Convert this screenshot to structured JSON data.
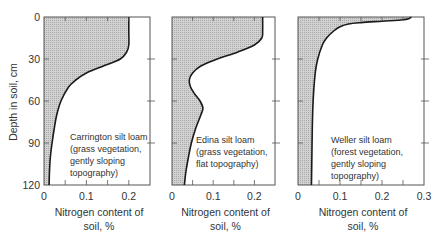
{
  "chart_data": [
    {
      "type": "area",
      "title": "Carrington silt loam",
      "annotation": [
        "Carrington silt loam",
        "(grass vegetation,",
        "gently sloping",
        "topography)"
      ],
      "xlabel": [
        "Nitrogen content of",
        "soil, %"
      ],
      "ylabel": "Depth in soil, cm",
      "xlim": [
        0,
        0.25
      ],
      "ylim": [
        120,
        0
      ],
      "xticks": [
        "0",
        "0.1",
        "0.2"
      ],
      "yticks": [
        "0",
        "30",
        "60",
        "90",
        "120"
      ],
      "depth_cm": [
        0,
        10,
        20,
        25,
        30,
        35,
        40,
        45,
        50,
        60,
        70,
        80,
        90,
        100,
        110,
        120
      ],
      "nitrogen_pct": [
        0.2,
        0.2,
        0.2,
        0.195,
        0.18,
        0.14,
        0.1,
        0.075,
        0.058,
        0.04,
        0.03,
        0.024,
        0.019,
        0.015,
        0.013,
        0.012
      ]
    },
    {
      "type": "area",
      "title": "Edina silt loam",
      "annotation": [
        "Edina silt loam",
        "(grass vegetation,",
        "flat topography)"
      ],
      "xlabel": [
        "Nitrogen content of",
        "soil, %"
      ],
      "ylabel": "",
      "xlim": [
        0,
        0.25
      ],
      "ylim": [
        120,
        0
      ],
      "xticks": [
        "0",
        "0.1",
        "0.2"
      ],
      "yticks": [],
      "depth_cm": [
        0,
        10,
        15,
        20,
        25,
        30,
        35,
        40,
        45,
        50,
        55,
        60,
        65,
        70,
        80,
        90,
        100,
        110,
        120
      ],
      "nitrogen_pct": [
        0.22,
        0.22,
        0.218,
        0.2,
        0.16,
        0.11,
        0.07,
        0.05,
        0.042,
        0.045,
        0.055,
        0.068,
        0.075,
        0.07,
        0.057,
        0.047,
        0.04,
        0.034,
        0.03
      ]
    },
    {
      "type": "area",
      "title": "Weller silt loam",
      "annotation": [
        "Weller silt loam",
        "(forest vegetation,",
        "gently sloping",
        "topography)"
      ],
      "xlabel": [
        "Nitrogen content of",
        "soil, %"
      ],
      "ylabel": "",
      "xlim": [
        0,
        0.3
      ],
      "ylim": [
        120,
        0
      ],
      "xticks": [
        "0",
        "0.1",
        "0.2",
        "0.3"
      ],
      "yticks": [],
      "depth_cm": [
        0,
        1,
        2,
        3,
        4,
        5,
        7,
        10,
        15,
        20,
        30,
        40,
        60,
        80,
        100,
        120
      ],
      "nitrogen_pct": [
        0.27,
        0.265,
        0.25,
        0.2,
        0.15,
        0.12,
        0.1,
        0.085,
        0.068,
        0.058,
        0.047,
        0.041,
        0.036,
        0.034,
        0.033,
        0.032
      ]
    }
  ],
  "colors": {
    "fill": "#c8c8c8",
    "line": "#1a1a1a",
    "axis": "#555555"
  }
}
